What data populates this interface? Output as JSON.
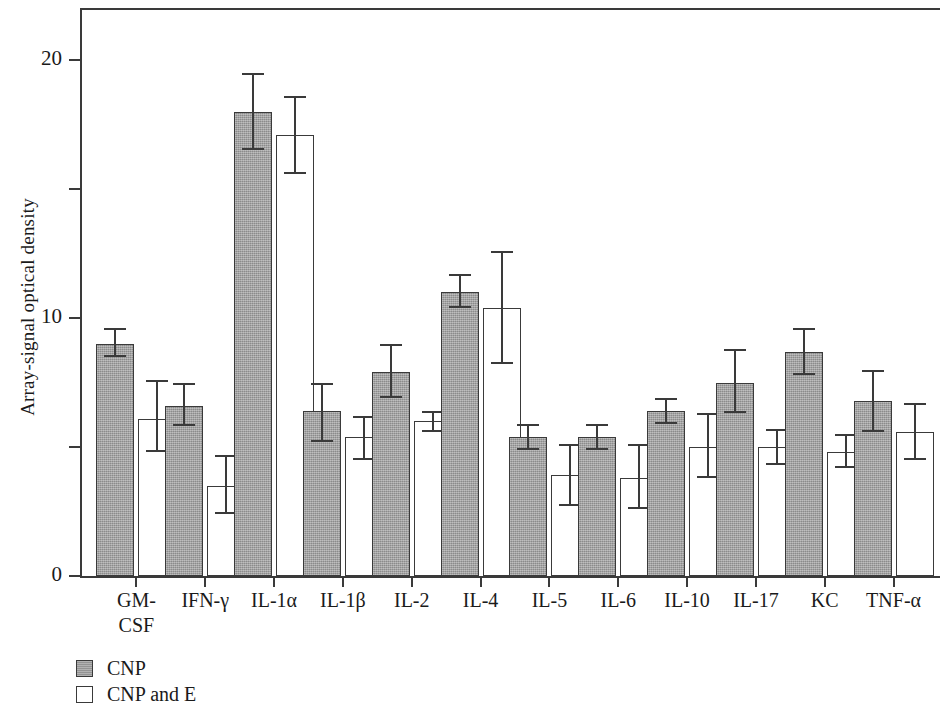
{
  "chart_data": {
    "type": "bar",
    "title": "",
    "xlabel": "",
    "ylabel": "Array-signal optical density",
    "ylim": [
      0,
      22
    ],
    "yticks": [
      0,
      5,
      10,
      15,
      20
    ],
    "ytick_labels": [
      "0",
      "",
      "10",
      "",
      "20"
    ],
    "grid": false,
    "legend_position": "below-left",
    "categories": [
      "GM-\nCSF",
      "IFN-γ",
      "IL-1α",
      "IL-1β",
      "IL-2",
      "IL-4",
      "IL-5",
      "IL-6",
      "IL-10",
      "IL-17",
      "KC",
      "TNF-α"
    ],
    "series": [
      {
        "name": "CNP",
        "fill": "#9c9c9c",
        "values": [
          9.0,
          6.6,
          18.0,
          6.4,
          7.9,
          11.0,
          5.4,
          5.4,
          6.4,
          7.5,
          8.7,
          6.8
        ],
        "err_low": [
          8.5,
          5.8,
          16.5,
          5.2,
          6.9,
          10.4,
          4.9,
          4.9,
          5.9,
          6.3,
          7.8,
          5.6
        ],
        "err_high": [
          9.6,
          7.5,
          19.5,
          7.5,
          9.0,
          11.7,
          5.9,
          5.9,
          6.9,
          8.8,
          9.6,
          8.0
        ]
      },
      {
        "name": "CNP and E",
        "fill": "#ffffff",
        "values": [
          6.1,
          3.5,
          17.1,
          5.4,
          6.0,
          10.4,
          3.9,
          3.8,
          5.0,
          5.0,
          4.8,
          5.6
        ],
        "err_low": [
          4.8,
          2.4,
          15.6,
          4.5,
          5.6,
          8.2,
          2.7,
          2.6,
          3.8,
          4.3,
          4.2,
          4.5
        ],
        "err_high": [
          7.6,
          4.7,
          18.6,
          6.2,
          6.4,
          12.6,
          5.1,
          5.1,
          6.3,
          5.7,
          5.5,
          6.7
        ]
      }
    ]
  },
  "legend": {
    "items": [
      {
        "label": "CNP",
        "style": "filled"
      },
      {
        "label": "CNP and E",
        "style": "open"
      }
    ]
  }
}
